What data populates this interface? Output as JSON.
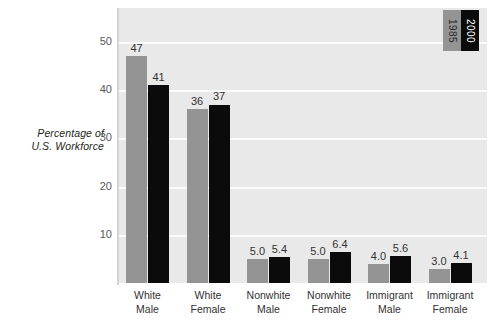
{
  "chart_data": {
    "type": "bar",
    "title": "",
    "xlabel": "",
    "ylabel": "Percentage of U.S. Workforce",
    "ylim": [
      0,
      57
    ],
    "yticks": [
      10,
      20,
      30,
      40,
      50
    ],
    "grid": true,
    "legend_position": "top-right",
    "categories": [
      "White Male",
      "White Female",
      "Nonwhite Male",
      "Nonwhite Female",
      "Immigrant Male",
      "Immigrant Female"
    ],
    "category_lines": [
      [
        "White",
        "Male"
      ],
      [
        "White",
        "Female"
      ],
      [
        "Nonwhite",
        "Male"
      ],
      [
        "Nonwhite",
        "Female"
      ],
      [
        "Immigrant",
        "Male"
      ],
      [
        "Immigrant",
        "Female"
      ]
    ],
    "series": [
      {
        "name": "1985",
        "color": "#949494",
        "values": [
          47,
          36,
          5.0,
          5.0,
          4.0,
          3.0
        ],
        "labels": [
          "47",
          "36",
          "5.0",
          "5.0",
          "4.0",
          "3.0"
        ]
      },
      {
        "name": "2000",
        "color": "#0b0b0b",
        "values": [
          41,
          37,
          5.4,
          6.4,
          5.6,
          4.1
        ],
        "labels": [
          "41",
          "37",
          "5.4",
          "6.4",
          "5.6",
          "4.1"
        ]
      }
    ]
  },
  "axis": {
    "y_title_line1": "Percentage of",
    "y_title_line2": "U.S. Workforce",
    "tick_labels": [
      "50",
      "40",
      "30",
      "20",
      "10"
    ]
  },
  "legend": {
    "items": [
      {
        "label": "1985",
        "color": "#949494"
      },
      {
        "label": "2000",
        "color": "#0b0b0b"
      }
    ]
  },
  "colors": {
    "plot_background": "#e9e9e9",
    "gridline": "#fbfbfb",
    "series_1985": "#949494",
    "series_2000": "#0b0b0b",
    "text": "#333132"
  }
}
